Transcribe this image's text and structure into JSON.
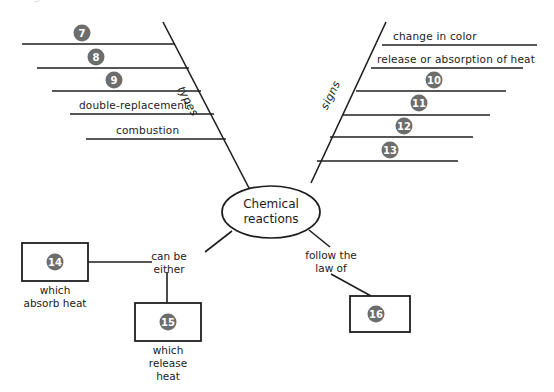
{
  "diagram": {
    "type": "fishbone-concept-map",
    "center": {
      "line1": "Chemical",
      "line2": "reactions"
    },
    "cut_off_top_text": "s",
    "colors": {
      "badge_fill": "#6d6d6d",
      "badge_text": "#ffffff",
      "line": "#1e1e1e",
      "background": "#ffffff"
    },
    "left_branch": {
      "label": "types",
      "ribs": [
        {
          "badge": "7",
          "text": ""
        },
        {
          "badge": "8",
          "text": ""
        },
        {
          "badge": "9",
          "text": ""
        },
        {
          "badge": "",
          "text": "double-replacement"
        },
        {
          "badge": "",
          "text": "combustion"
        }
      ]
    },
    "right_branch": {
      "label": "signs",
      "ribs": [
        {
          "badge": "",
          "text": "change in color"
        },
        {
          "badge": "",
          "text": "release or absorption of heat"
        },
        {
          "badge": "10",
          "text": ""
        },
        {
          "badge": "11",
          "text": ""
        },
        {
          "badge": "12",
          "text": ""
        },
        {
          "badge": "13",
          "text": ""
        }
      ]
    },
    "bottom_left_branch": {
      "label_line1": "can be",
      "label_line2": "either",
      "boxes": [
        {
          "badge": "14",
          "caption_lines": [
            "which",
            "absorb heat"
          ]
        },
        {
          "badge": "15",
          "caption_lines": [
            "which",
            "release",
            "heat"
          ]
        }
      ]
    },
    "bottom_right_branch": {
      "label_line1": "follow the",
      "label_line2": "law of",
      "boxes": [
        {
          "badge": "16",
          "caption_lines": []
        }
      ]
    }
  }
}
